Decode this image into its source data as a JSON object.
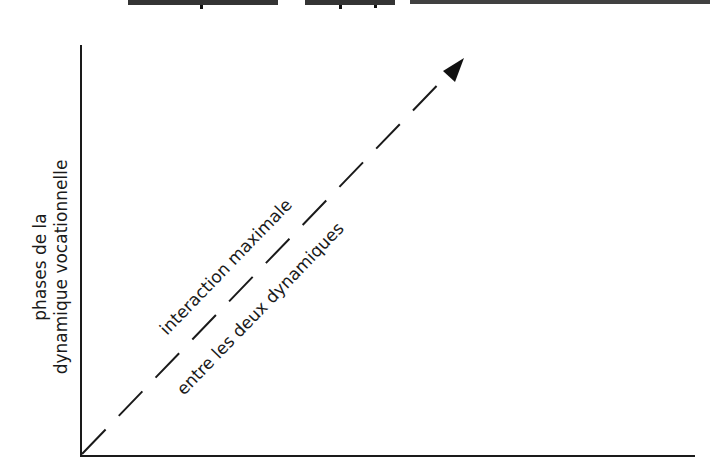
{
  "title": {
    "visible": "clipped",
    "text": ""
  },
  "diagram": {
    "y_axis_label_lines": [
      "phases de la",
      "dynamique vocationnelle"
    ],
    "x_axis_label": "",
    "arrow_label_upper": "interaction maximale",
    "arrow_label_lower": "entre les deux dynamiques",
    "arrow_style": "dashed",
    "line_color": "#1a1a1a"
  }
}
